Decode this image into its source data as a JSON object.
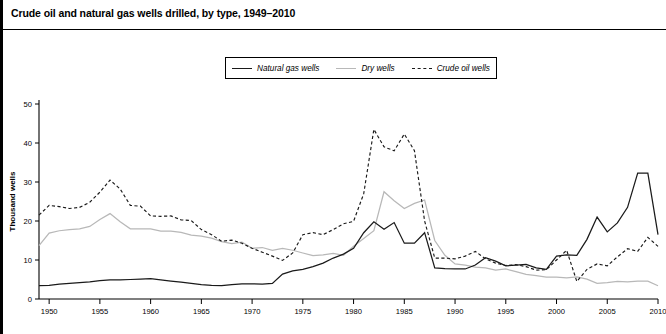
{
  "header": {
    "title": "Crude oil and natural gas wells drilled, by type, 1949–2010"
  },
  "legend": {
    "position": "top-center",
    "items": [
      {
        "label": "Natural gas wells",
        "style": "solid",
        "color": "#1a1a1a"
      },
      {
        "label": "Dry wells",
        "style": "solid",
        "color": "#b8b8b8"
      },
      {
        "label": "Crude oil wells",
        "style": "dashed",
        "color": "#1a1a1a"
      }
    ]
  },
  "axes": {
    "ylabel": "Thousand wells",
    "yticks": [
      "0",
      "10",
      "20",
      "30",
      "40",
      "50"
    ],
    "xticks": [
      "1950",
      "1955",
      "1960",
      "1965",
      "1970",
      "1975",
      "1980",
      "1985",
      "1990",
      "1995",
      "2000",
      "2005",
      "2010"
    ]
  },
  "chart_data": {
    "type": "line",
    "title": "Crude oil and natural gas wells drilled, by type, 1949–2010",
    "xlabel": "",
    "ylabel": "Thousand wells",
    "xlim": [
      1949,
      2010
    ],
    "ylim": [
      0,
      50
    ],
    "grid": false,
    "legend_position": "top-center",
    "x": [
      1949,
      1950,
      1951,
      1952,
      1953,
      1954,
      1955,
      1956,
      1957,
      1958,
      1959,
      1960,
      1961,
      1962,
      1963,
      1964,
      1965,
      1966,
      1967,
      1968,
      1969,
      1970,
      1971,
      1972,
      1973,
      1974,
      1975,
      1976,
      1977,
      1978,
      1979,
      1980,
      1981,
      1982,
      1983,
      1984,
      1985,
      1986,
      1987,
      1988,
      1989,
      1990,
      1991,
      1992,
      1993,
      1994,
      1995,
      1996,
      1997,
      1998,
      1999,
      2000,
      2001,
      2002,
      2003,
      2004,
      2005,
      2006,
      2007,
      2008,
      2009,
      2010
    ],
    "series": [
      {
        "name": "Natural gas wells",
        "style": "solid",
        "color": "#1a1a1a",
        "values": [
          3.4,
          3.5,
          3.8,
          4.0,
          4.2,
          4.4,
          4.7,
          4.9,
          4.9,
          5.0,
          5.1,
          5.2,
          4.9,
          4.6,
          4.3,
          4.0,
          3.7,
          3.5,
          3.4,
          3.7,
          3.9,
          3.9,
          3.8,
          4.0,
          6.4,
          7.2,
          7.6,
          8.3,
          9.2,
          10.5,
          11.5,
          13.0,
          17.0,
          19.8,
          17.9,
          19.6,
          14.3,
          14.3,
          17.0,
          8.0,
          7.8,
          7.7,
          7.7,
          8.7,
          10.6,
          9.7,
          8.5,
          8.7,
          8.9,
          8.0,
          7.6,
          11.0,
          11.3,
          11.2,
          15.3,
          21.0,
          17.2,
          19.5,
          23.5,
          32.3,
          32.3,
          16.5
        ]
      },
      {
        "name": "Dry wells",
        "style": "solid",
        "color": "#b8b8b8",
        "values": [
          13.7,
          16.9,
          17.5,
          17.8,
          18.0,
          18.6,
          20.4,
          21.9,
          19.8,
          18.0,
          18.0,
          18.0,
          17.4,
          17.4,
          17.1,
          16.4,
          16.1,
          15.6,
          14.7,
          14.2,
          14.6,
          13.0,
          13.2,
          12.5,
          13.0,
          12.5,
          11.8,
          11.1,
          11.3,
          11.7,
          11.2,
          13.5,
          15.5,
          17.5,
          27.5,
          25.2,
          23.2,
          24.5,
          25.4,
          15.0,
          11.2,
          9.0,
          8.7,
          8.2,
          8.0,
          7.4,
          7.7,
          7.0,
          6.3,
          6.0,
          5.6,
          5.6,
          5.4,
          5.7,
          5.1,
          4.0,
          4.2,
          4.5,
          4.4,
          4.6,
          4.6,
          3.4
        ]
      },
      {
        "name": "Crude oil wells",
        "style": "dashed",
        "color": "#1a1a1a",
        "values": [
          21.5,
          24.0,
          23.7,
          23.2,
          23.5,
          24.8,
          27.4,
          30.5,
          28.2,
          24.0,
          23.8,
          21.3,
          21.2,
          21.3,
          20.3,
          20.1,
          17.8,
          16.5,
          14.8,
          15.1,
          14.3,
          13.0,
          12.0,
          11.0,
          9.9,
          11.8,
          16.5,
          17.0,
          16.5,
          17.8,
          19.3,
          19.9,
          27.0,
          43.5,
          39.0,
          38.0,
          42.3,
          38.0,
          20.0,
          10.5,
          10.5,
          10.3,
          11.0,
          12.2,
          10.3,
          9.2,
          8.6,
          8.8,
          8.3,
          7.4,
          7.5,
          10.0,
          12.5,
          4.5,
          7.6,
          9.0,
          8.5,
          10.8,
          12.9,
          12.2,
          15.8,
          13.5
        ]
      }
    ]
  },
  "source": {
    "text": ""
  }
}
